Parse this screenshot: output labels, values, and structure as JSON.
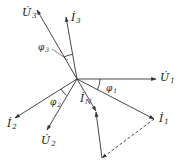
{
  "diagram": {
    "type": "three-phase phasor diagram",
    "origin": [
      77,
      79
    ],
    "colors": {
      "line": "#333333",
      "text": "#222222",
      "background": "#ffffff"
    },
    "vectors": [
      {
        "id": "U1",
        "symbol": "U̇",
        "subscript": "1",
        "from": [
          77,
          79
        ],
        "to": [
          156,
          79
        ]
      },
      {
        "id": "I1",
        "symbol": "İ",
        "subscript": "1",
        "from": [
          77,
          79
        ],
        "to": [
          154,
          119
        ]
      },
      {
        "id": "U3",
        "symbol": "U̇",
        "subscript": "3",
        "from": [
          77,
          79
        ],
        "to": [
          37,
          10
        ]
      },
      {
        "id": "I3",
        "symbol": "İ",
        "subscript": "3",
        "from": [
          77,
          79
        ],
        "to": [
          66,
          17
        ]
      },
      {
        "id": "I2",
        "symbol": "İ",
        "subscript": "2",
        "from": [
          77,
          79
        ],
        "to": [
          15,
          118
        ]
      },
      {
        "id": "U2",
        "symbol": "U̇",
        "subscript": "2",
        "from": [
          77,
          79
        ],
        "to": [
          47,
          130
        ]
      },
      {
        "id": "IN",
        "symbol": "İ",
        "subscript": "N",
        "from": [
          77,
          79
        ],
        "to": [
          96,
          111
        ]
      }
    ],
    "construction_lines": [
      {
        "id": "I3-translated-dashed",
        "style": "dashed",
        "from": [
          154,
          119
        ],
        "to": [
          102,
          158
        ]
      },
      {
        "id": "I2-translated",
        "style": "solid",
        "from": [
          102,
          158
        ],
        "to": [
          96,
          111
        ]
      }
    ],
    "angles": [
      {
        "id": "phi1",
        "label": "φ",
        "subscript": "1",
        "between": [
          "U1",
          "I1"
        ]
      },
      {
        "id": "phi2",
        "label": "φ",
        "subscript": "2",
        "between": [
          "I2",
          "U2"
        ]
      },
      {
        "id": "phi3",
        "label": "φ",
        "subscript": "3",
        "between": [
          "U3",
          "I3"
        ]
      }
    ],
    "labels": {
      "U1": {
        "main": "U̇",
        "sub": "1"
      },
      "I1": {
        "main": "İ",
        "sub": "1"
      },
      "U2": {
        "main": "U̇",
        "sub": "2"
      },
      "I2": {
        "main": "İ",
        "sub": "2"
      },
      "U3": {
        "main": "U̇",
        "sub": "3"
      },
      "I3": {
        "main": "İ",
        "sub": "3"
      },
      "IN": {
        "main": "İ",
        "sub": "N"
      },
      "phi1": {
        "main": "φ",
        "sub": "1"
      },
      "phi2": {
        "main": "φ",
        "sub": "2"
      },
      "phi3": {
        "main": "φ",
        "sub": "3"
      }
    }
  }
}
